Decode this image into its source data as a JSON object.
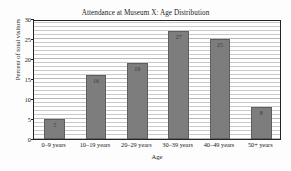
{
  "chart_data": {
    "type": "bar",
    "title": "Attendance at Museum X: Age Distribution",
    "xlabel": "Age",
    "ylabel": "Percent of total visitors",
    "categories": [
      "0–9 years",
      "10–19 years",
      "20–29 years",
      "30–39 years",
      "40–49 years",
      "50+ years"
    ],
    "values": [
      5,
      16,
      19,
      27,
      25,
      8
    ],
    "value_labels": [
      "5",
      "16",
      "19",
      "27",
      "25",
      "8"
    ],
    "ylim": [
      0,
      30
    ],
    "ytick_labels": [
      "0",
      "5",
      "10",
      "15",
      "20",
      "25",
      "30"
    ],
    "ytick_values": [
      0,
      5,
      10,
      15,
      20,
      25,
      30
    ],
    "grid": "horizontal",
    "gridline_step": 1,
    "legend": null,
    "bar_color": "#7d7d7d",
    "bar_edge_color": "#5e5e5e",
    "gridline_color": "#c9c9c9",
    "axis_color": "#242424",
    "background_color": "#ffffff"
  }
}
